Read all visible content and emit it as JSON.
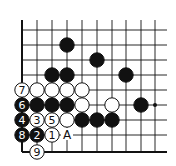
{
  "diagram": {
    "type": "go-board-partial",
    "grid": {
      "columns_x": [
        22,
        37,
        52,
        67,
        82,
        97,
        112,
        126,
        141,
        155
      ],
      "rows_y": [
        30,
        45,
        60,
        75,
        90,
        105,
        120,
        135,
        152
      ],
      "top_y": 20,
      "right_x": 167,
      "left_edge": true,
      "bottom_edge": true
    },
    "colors": {
      "line": "#111111",
      "black_stone": "#111111",
      "white_stone": "#ffffff",
      "background": "#ffffff"
    },
    "star_points": [
      {
        "col": 9,
        "row": 5
      }
    ],
    "stones": [
      {
        "col": 3,
        "row": 1,
        "color": "black",
        "label": ""
      },
      {
        "col": 5,
        "row": 2,
        "color": "black",
        "label": ""
      },
      {
        "col": 2,
        "row": 3,
        "color": "black",
        "label": ""
      },
      {
        "col": 3,
        "row": 3,
        "color": "black",
        "label": ""
      },
      {
        "col": 7,
        "row": 3,
        "color": "black",
        "label": ""
      },
      {
        "col": 0,
        "row": 4,
        "color": "white",
        "label": "7"
      },
      {
        "col": 1,
        "row": 4,
        "color": "white",
        "label": ""
      },
      {
        "col": 2,
        "row": 4,
        "color": "white",
        "label": ""
      },
      {
        "col": 3,
        "row": 4,
        "color": "white",
        "label": ""
      },
      {
        "col": 4,
        "row": 4,
        "color": "white",
        "label": ""
      },
      {
        "col": 0,
        "row": 5,
        "color": "black",
        "label": "6"
      },
      {
        "col": 1,
        "row": 5,
        "color": "black",
        "label": ""
      },
      {
        "col": 2,
        "row": 5,
        "color": "black",
        "label": ""
      },
      {
        "col": 3,
        "row": 5,
        "color": "black",
        "label": ""
      },
      {
        "col": 4,
        "row": 5,
        "color": "white",
        "label": ""
      },
      {
        "col": 6,
        "row": 5,
        "color": "white",
        "label": ""
      },
      {
        "col": 8,
        "row": 5,
        "color": "black",
        "label": ""
      },
      {
        "col": 0,
        "row": 6,
        "color": "black",
        "label": "4"
      },
      {
        "col": 1,
        "row": 6,
        "color": "white",
        "label": "3"
      },
      {
        "col": 2,
        "row": 6,
        "color": "white",
        "label": "5"
      },
      {
        "col": 3,
        "row": 6,
        "color": "white",
        "label": ""
      },
      {
        "col": 4,
        "row": 6,
        "color": "black",
        "label": ""
      },
      {
        "col": 5,
        "row": 6,
        "color": "black",
        "label": ""
      },
      {
        "col": 6,
        "row": 6,
        "color": "black",
        "label": ""
      },
      {
        "col": 0,
        "row": 7,
        "color": "black",
        "label": "8"
      },
      {
        "col": 1,
        "row": 7,
        "color": "black",
        "label": "2"
      },
      {
        "col": 2,
        "row": 7,
        "color": "white",
        "label": "1"
      },
      {
        "col": 1,
        "row": 8,
        "color": "white",
        "label": "9"
      }
    ],
    "markers": [
      {
        "col": 3,
        "row": 7,
        "text": "A"
      }
    ]
  }
}
